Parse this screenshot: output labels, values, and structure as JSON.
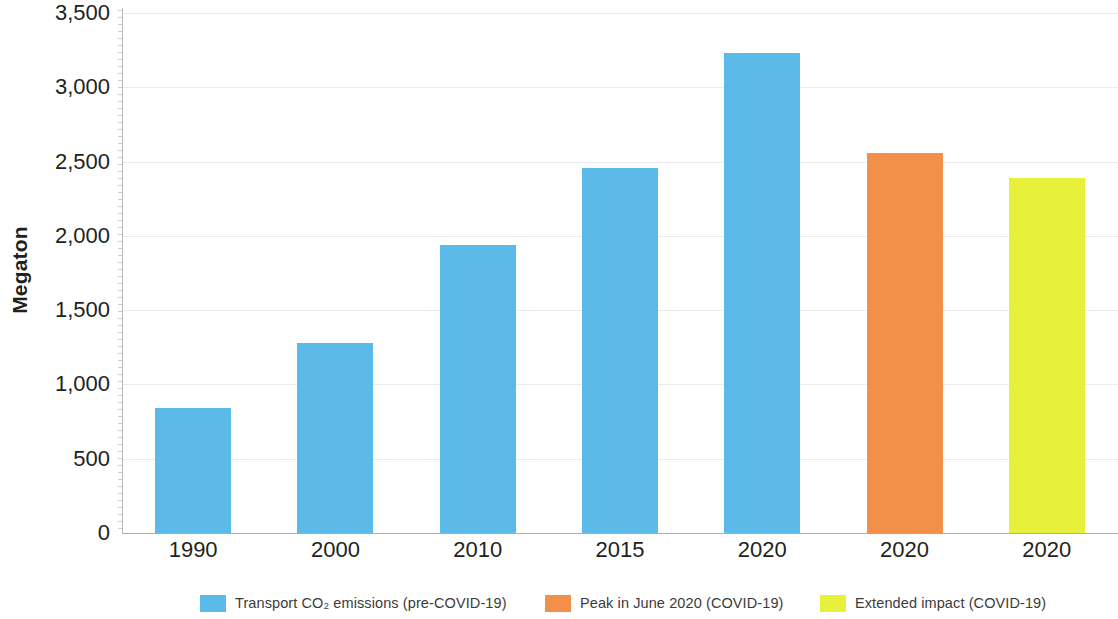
{
  "chart_data": {
    "type": "bar",
    "title": "",
    "subtitle": "",
    "xlabel": "",
    "ylabel": "Megaton",
    "ylim": [
      0,
      3500
    ],
    "ytick_step": 500,
    "grid": true,
    "legend_position": "bottom",
    "categories": [
      "1990",
      "2000",
      "2010",
      "2015",
      "2020",
      "2020",
      "2020"
    ],
    "values": [
      840,
      1280,
      1940,
      2460,
      3230,
      2560,
      2390
    ],
    "bar_series": [
      "Transport CO₂ emissions (pre-COVID-19)",
      "Transport CO₂ emissions (pre-COVID-19)",
      "Transport CO₂ emissions (pre-COVID-19)",
      "Transport CO₂ emissions (pre-COVID-19)",
      "Transport CO₂ emissions (pre-COVID-19)",
      "Peak in June 2020 (COVID-19)",
      "Extended impact (COVID-19)"
    ],
    "bar_colors": [
      "#5CBAE8",
      "#5CBAE8",
      "#5CBAE8",
      "#5CBAE8",
      "#5CBAE8",
      "#F2904A",
      "#E7F03B"
    ],
    "ytick_labels": [
      "3,500",
      "3,000",
      "2,500",
      "2,000",
      "1,500",
      "1,000",
      "500",
      "0"
    ],
    "ytick_values": [
      3500,
      3000,
      2500,
      2000,
      1500,
      1000,
      500,
      0
    ],
    "series": [
      {
        "name": "Transport CO₂ emissions (pre-COVID-19)",
        "color": "#5CBAE8",
        "points": [
          {
            "category": "1990",
            "value": 840
          },
          {
            "category": "2000",
            "value": 1280
          },
          {
            "category": "2010",
            "value": 1940
          },
          {
            "category": "2015",
            "value": 2460
          },
          {
            "category": "2020",
            "value": 3230
          }
        ]
      },
      {
        "name": "Peak in June 2020 (COVID-19)",
        "color": "#F2904A",
        "points": [
          {
            "category": "2020",
            "value": 2560
          }
        ]
      },
      {
        "name": "Extended impact (COVID-19)",
        "color": "#E7F03B",
        "points": [
          {
            "category": "2020",
            "value": 2390
          }
        ]
      }
    ],
    "legend": [
      {
        "label": "Transport CO₂ emissions (pre-COVID-19)",
        "color": "#5CBAE8"
      },
      {
        "label": "Peak in June 2020 (COVID-19)",
        "color": "#F2904A"
      },
      {
        "label": "Extended impact (COVID-19)",
        "color": "#E7F03B"
      }
    ]
  },
  "axis": {
    "y_title": "Megaton"
  },
  "colors": {
    "blue": "#5CBAE8",
    "orange": "#F2904A",
    "yellow": "#E7F03B",
    "gridline": "#eceaea",
    "axis": "#b0aeab",
    "text": "#231f20",
    "legend_text": "#3b3b3b"
  }
}
